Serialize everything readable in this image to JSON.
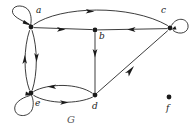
{
  "figure": {
    "graph_name": "G",
    "background_color": "#ffffff",
    "stroke_color": "#1a1a1a",
    "label_color": "#1a1a1a",
    "caption_color": "#555555",
    "width": 195,
    "height": 133
  },
  "vertices": [
    {
      "id": "a",
      "label": "a",
      "x": 31,
      "y": 27,
      "label_x": 36,
      "label_y": 12
    },
    {
      "id": "b",
      "label": "b",
      "x": 95,
      "y": 30,
      "label_x": 99,
      "label_y": 34
    },
    {
      "id": "c",
      "label": "c",
      "x": 170,
      "y": 28,
      "label_x": 162,
      "label_y": 12
    },
    {
      "id": "d",
      "label": "d",
      "x": 95,
      "y": 95,
      "label_x": 92,
      "label_y": 102
    },
    {
      "id": "e",
      "label": "e",
      "x": 31,
      "y": 93,
      "label_x": 35,
      "label_y": 100
    },
    {
      "id": "f",
      "label": "f",
      "x": 169,
      "y": 97,
      "label_x": 166,
      "label_y": 104
    }
  ],
  "edges": [
    {
      "from": "a",
      "to": "a",
      "kind": "self-loop",
      "direction": "upper-left"
    },
    {
      "from": "c",
      "to": "c",
      "kind": "self-loop",
      "direction": "right"
    },
    {
      "from": "e",
      "to": "e",
      "kind": "self-loop",
      "direction": "lower-left"
    },
    {
      "from": "a",
      "to": "c",
      "kind": "arc",
      "direction": "top-curve-right"
    },
    {
      "from": "a",
      "to": "b",
      "kind": "straight",
      "direction": "right"
    },
    {
      "from": "c",
      "to": "b",
      "kind": "straight",
      "direction": "left"
    },
    {
      "from": "b",
      "to": "d",
      "kind": "straight",
      "direction": "down"
    },
    {
      "from": "d",
      "to": "c",
      "kind": "straight",
      "direction": "up-right"
    },
    {
      "from": "a",
      "to": "e",
      "kind": "arc",
      "direction": "down"
    },
    {
      "from": "e",
      "to": "a",
      "kind": "arc",
      "direction": "up"
    },
    {
      "from": "e",
      "to": "d",
      "kind": "arc",
      "direction": "right"
    },
    {
      "from": "d",
      "to": "e",
      "kind": "arc",
      "direction": "left"
    }
  ]
}
